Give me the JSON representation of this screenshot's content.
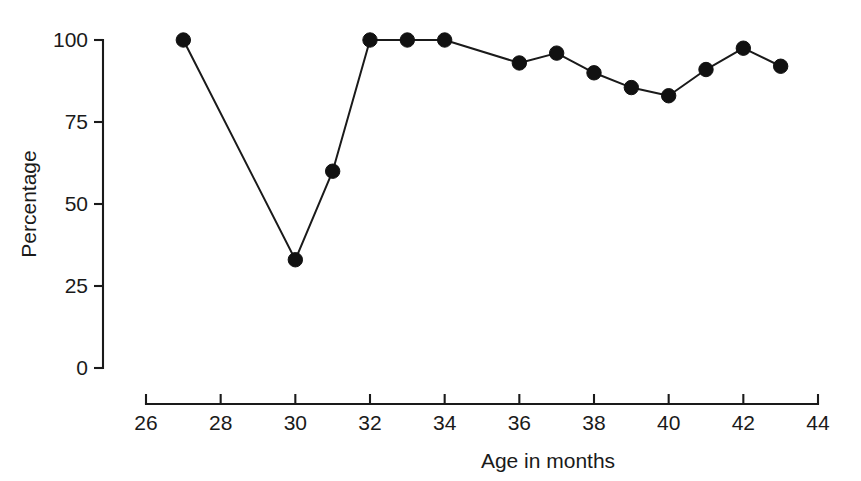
{
  "chart_data": {
    "type": "line",
    "title": "",
    "xlabel": "Age in months",
    "ylabel": "Percentage",
    "xlim": [
      26,
      44
    ],
    "ylim": [
      0,
      100
    ],
    "xticks": [
      26,
      28,
      30,
      32,
      34,
      36,
      38,
      40,
      42,
      44
    ],
    "xtick_labels": [
      "26",
      "28",
      "30",
      "32",
      "34",
      "36",
      "38",
      "40",
      "42",
      "44"
    ],
    "yticks": [
      0,
      25,
      50,
      75,
      100
    ],
    "ytick_labels": [
      "0",
      "25",
      "50",
      "75",
      "100"
    ],
    "grid": false,
    "legend": false,
    "marker": "filled-circle",
    "line_color": "#1a1a1a",
    "marker_color": "#111111",
    "background_color": "#ffffff",
    "x": [
      27,
      30,
      31,
      32,
      33,
      34,
      36,
      37,
      38,
      39,
      40,
      41,
      42,
      43
    ],
    "values": [
      100,
      33,
      60,
      100,
      100,
      100,
      93,
      96,
      90,
      85.5,
      83,
      91,
      97.5,
      92
    ],
    "series": [
      {
        "name": "Percentage",
        "points": [
          {
            "x": 27,
            "y": 100
          },
          {
            "x": 30,
            "y": 33
          },
          {
            "x": 31,
            "y": 60
          },
          {
            "x": 32,
            "y": 100
          },
          {
            "x": 33,
            "y": 100
          },
          {
            "x": 34,
            "y": 100
          },
          {
            "x": 36,
            "y": 93
          },
          {
            "x": 37,
            "y": 96
          },
          {
            "x": 38,
            "y": 90
          },
          {
            "x": 39,
            "y": 85.5
          },
          {
            "x": 40,
            "y": 83
          },
          {
            "x": 41,
            "y": 91
          },
          {
            "x": 42,
            "y": 97.5
          },
          {
            "x": 43,
            "y": 92
          }
        ]
      }
    ]
  }
}
